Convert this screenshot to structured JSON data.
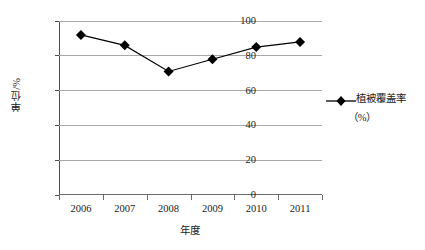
{
  "chart_data": {
    "type": "line",
    "title": "",
    "subtitle": "",
    "xlabel": "年度",
    "ylabel": "单位/%",
    "categories": [
      "2006",
      "2007",
      "2008",
      "2009",
      "2010",
      "2011"
    ],
    "series": [
      {
        "name": "植被覆盖率（%）",
        "values": [
          92,
          86,
          71,
          78,
          85,
          88
        ],
        "marker": "diamond",
        "color": "#000000"
      }
    ],
    "ylim": [
      0,
      100
    ],
    "ytick_labels": [
      "0",
      "20",
      "40",
      "60",
      "80",
      "100"
    ],
    "ytick_values": [
      0,
      20,
      40,
      60,
      80,
      100
    ],
    "grid": "horizontal",
    "legend_position": "right",
    "legend": {
      "label_line1": "植被覆盖率",
      "label_line2": "（%）"
    }
  },
  "icons": {
    "marker": "diamond-marker-icon",
    "legend_marker": "legend-diamond-icon"
  }
}
